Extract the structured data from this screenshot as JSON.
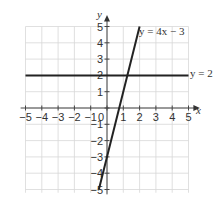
{
  "chart_data": {
    "type": "line",
    "title": "",
    "xlabel": "x",
    "ylabel": "y",
    "xlim": [
      -5,
      5
    ],
    "ylim": [
      -5,
      5
    ],
    "grid": true,
    "x_ticks": [
      "-5",
      "-4",
      "-3",
      "-2",
      "-1",
      "0",
      "1",
      "2",
      "3",
      "4",
      "5"
    ],
    "y_ticks": [
      "5",
      "4",
      "3",
      "2",
      "1",
      "-1",
      "-2",
      "-3",
      "-4",
      "-5"
    ],
    "origin_label": "0",
    "series": [
      {
        "name": "y = 4x − 3",
        "equation": "y = 4x − 3",
        "x": [
          -0.5,
          2
        ],
        "y": [
          -5,
          5
        ],
        "color": "#222222"
      },
      {
        "name": "y = 2",
        "equation": "y = 2",
        "x": [
          -5,
          5
        ],
        "y": [
          2,
          2
        ],
        "color": "#222222"
      }
    ],
    "intersection": {
      "x": 1.25,
      "y": 2
    }
  },
  "labels": {
    "x_axis": "x",
    "y_axis": "y",
    "line1": "y = 4x − 3",
    "line2": "y = 2"
  }
}
